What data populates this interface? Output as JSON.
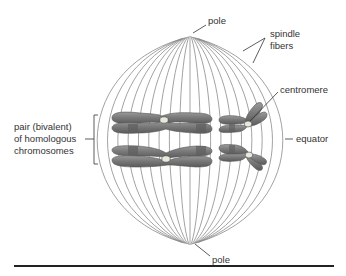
{
  "diagram": {
    "labels": {
      "pole_top": "pole",
      "pole_bottom": "pole",
      "spindle_fibers_line1": "spindle",
      "spindle_fibers_line2": "fibers",
      "centromere": "centromere",
      "equator": "equator",
      "bivalent_line1": "pair (bivalent)",
      "bivalent_line2": "of homologous",
      "bivalent_line3": "chromosomes"
    },
    "fiber_count": 19,
    "colors": {
      "fiber": "#8a8a8a",
      "chromosome_fill": "#7d7d7d",
      "chromosome_dark": "#5c5c5c",
      "chromosome_light": "#a8a8a8",
      "centromere": "#e6e6d8",
      "leader": "#333333",
      "rule": "#222222"
    }
  }
}
